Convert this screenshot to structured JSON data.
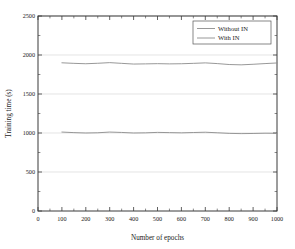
{
  "chart_data": {
    "type": "line",
    "title": "",
    "xlabel": "Number of epochs",
    "ylabel": "Training time (s)",
    "xlim": [
      0,
      1000
    ],
    "ylim": [
      0,
      2500
    ],
    "xticks": [
      0,
      100,
      200,
      300,
      400,
      500,
      600,
      700,
      800,
      900,
      1000
    ],
    "xticklabels": [
      "0",
      "100",
      "200",
      "300",
      "400",
      "500",
      "600",
      "700",
      "800",
      "900",
      "1000"
    ],
    "yticks": [
      0,
      500,
      1000,
      1500,
      2000,
      2500
    ],
    "yticklabels": [
      "0",
      "500",
      "1000",
      "1500",
      "2000",
      "2500"
    ],
    "grid": "horizontal-major",
    "grid_color": "#d8d8d8",
    "legend_position": "top-right",
    "x": [
      100,
      150,
      200,
      250,
      300,
      350,
      400,
      450,
      500,
      550,
      600,
      650,
      700,
      750,
      800,
      850,
      900,
      950,
      1000
    ],
    "series": [
      {
        "name": "Without IN",
        "color": "#8c8c8c",
        "values": [
          1900,
          1893,
          1888,
          1894,
          1902,
          1893,
          1884,
          1886,
          1889,
          1886,
          1888,
          1893,
          1899,
          1890,
          1878,
          1874,
          1881,
          1890,
          1898
        ]
      },
      {
        "name": "With IN",
        "color": "#8c8c8c",
        "values": [
          1012,
          1005,
          1000,
          1003,
          1012,
          1007,
          1000,
          1002,
          1008,
          1005,
          1002,
          1006,
          1010,
          1003,
          995,
          992,
          994,
          997,
          996
        ]
      }
    ]
  },
  "legend": {
    "items": [
      {
        "label": "Without IN"
      },
      {
        "label": "With IN"
      }
    ]
  }
}
